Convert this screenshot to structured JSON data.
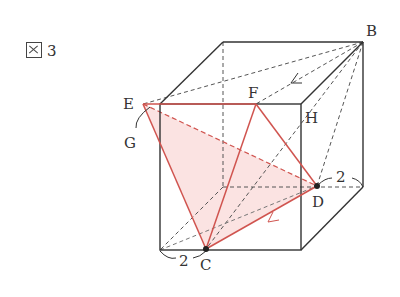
{
  "figure": {
    "label": "図 3",
    "label_number": "3"
  },
  "points": {
    "B": {
      "label": "B",
      "x": 363,
      "y": 42
    },
    "E": {
      "label": "E",
      "x": 143,
      "y": 104
    },
    "F": {
      "label": "F",
      "x": 256,
      "y": 104
    },
    "H": {
      "label": "H",
      "x": 301,
      "y": 104
    },
    "G": {
      "label": "G"
    },
    "D": {
      "label": "D",
      "x": 317,
      "y": 186
    },
    "C": {
      "label": "C",
      "x": 206,
      "y": 249
    }
  },
  "dimensions": {
    "bottom_left": "2",
    "right": "2"
  },
  "colors": {
    "edge": "#333333",
    "red_line": "#d0544f",
    "fill": "#fbe3e2"
  }
}
